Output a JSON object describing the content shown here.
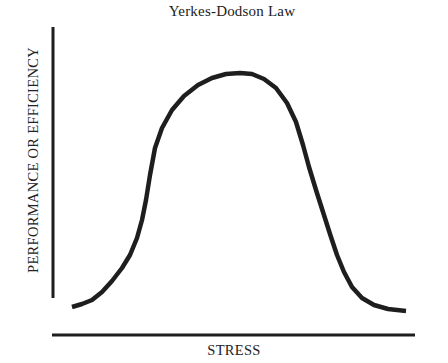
{
  "chart_data": {
    "type": "line",
    "title": "Yerkes-Dodson Law",
    "xlabel": "STRESS",
    "ylabel": "PERFORMANCE OR EFFICIENCY",
    "grid": false,
    "legend": null,
    "ticks": {
      "x": [],
      "y": []
    },
    "series": [
      {
        "name": "Performance",
        "x": [
          0,
          0.05,
          0.1,
          0.15,
          0.2,
          0.25,
          0.3,
          0.35,
          0.4,
          0.45,
          0.5,
          0.55,
          0.6,
          0.65,
          0.7,
          0.75,
          0.8,
          0.85,
          0.9,
          0.95,
          1.0
        ],
        "y": [
          0.03,
          0.05,
          0.1,
          0.2,
          0.36,
          0.56,
          0.72,
          0.84,
          0.93,
          0.98,
          1.0,
          0.99,
          0.94,
          0.83,
          0.65,
          0.47,
          0.3,
          0.15,
          0.06,
          0.03,
          0.02
        ]
      }
    ],
    "xlim": [
      0,
      1
    ],
    "ylim": [
      0,
      1
    ]
  },
  "plot_geometry": {
    "y_axis": {
      "x": 53,
      "y1": 27,
      "y2": 298
    },
    "x_axis": {
      "y": 335,
      "x1": 52,
      "x2": 415
    },
    "curve_points": [
      [
        72,
        307
      ],
      [
        82,
        304
      ],
      [
        92,
        300
      ],
      [
        102,
        292
      ],
      [
        112,
        281
      ],
      [
        122,
        268
      ],
      [
        130,
        255
      ],
      [
        137,
        238
      ],
      [
        142,
        220
      ],
      [
        146,
        200
      ],
      [
        150,
        175
      ],
      [
        155,
        148
      ],
      [
        162,
        128
      ],
      [
        172,
        110
      ],
      [
        184,
        96
      ],
      [
        198,
        85
      ],
      [
        212,
        78
      ],
      [
        226,
        74
      ],
      [
        240,
        73
      ],
      [
        252,
        74
      ],
      [
        264,
        79
      ],
      [
        276,
        88
      ],
      [
        287,
        103
      ],
      [
        296,
        122
      ],
      [
        303,
        145
      ],
      [
        309,
        167
      ],
      [
        316,
        190
      ],
      [
        323,
        212
      ],
      [
        330,
        234
      ],
      [
        337,
        255
      ],
      [
        344,
        272
      ],
      [
        352,
        287
      ],
      [
        362,
        298
      ],
      [
        374,
        305
      ],
      [
        388,
        309
      ],
      [
        406,
        311
      ]
    ],
    "stroke_color": "#1e1e1e"
  }
}
